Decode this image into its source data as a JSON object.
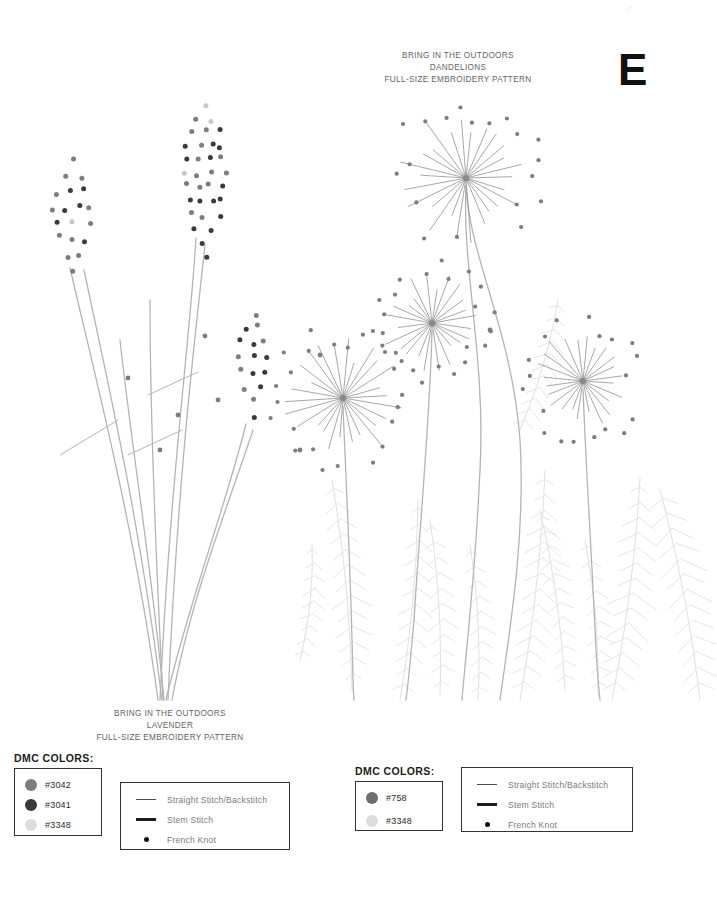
{
  "page": {
    "letter": "E",
    "background_color": "#ffffff"
  },
  "patterns": {
    "dandelions": {
      "brand_line": "BRING IN THE OUTDOORS",
      "name": "DANDELIONS",
      "subtitle": "FULL-SIZE EMBROIDERY PATTERN"
    },
    "lavender": {
      "brand_line": "BRING IN THE OUTDOORS",
      "name": "LAVENDER",
      "subtitle": "FULL-SIZE EMBROIDERY PATTERN"
    }
  },
  "legends": {
    "lavender": {
      "heading": "DMC COLORS:",
      "colors": [
        {
          "code": "#3042",
          "hex": "#7d7d7d"
        },
        {
          "code": "#3041",
          "hex": "#3a3a3a"
        },
        {
          "code": "#3348",
          "hex": "#dcdcdc"
        }
      ],
      "stitches": [
        {
          "label": "Straight Stitch/Backstitch",
          "mark": "thin-line"
        },
        {
          "label": "Stem Stitch",
          "mark": "thick-line"
        },
        {
          "label": "French Knot",
          "mark": "dot"
        }
      ]
    },
    "dandelions": {
      "heading": "DMC COLORS:",
      "colors": [
        {
          "code": "#758",
          "hex": "#6e6e6e"
        },
        {
          "code": "#3348",
          "hex": "#dcdcdc"
        }
      ],
      "stitches": [
        {
          "label": "Straight Stitch/Backstitch",
          "mark": "thin-line"
        },
        {
          "label": "Stem Stitch",
          "mark": "thick-line"
        },
        {
          "label": "French Knot",
          "mark": "dot"
        }
      ]
    }
  },
  "artwork": {
    "stem_color": "#b4b4b4",
    "foliage_color": "#e2e2e2",
    "ray_color": "#8a8a8a",
    "knot_dark": "#3a3a3a",
    "knot_mid": "#7d7d7d",
    "knot_light": "#c8c8c8",
    "dandelion_heads": [
      {
        "cx": 466,
        "cy": 178,
        "r_ray": 62,
        "r_dot": 76,
        "rays": 26
      },
      {
        "cx": 432,
        "cy": 323,
        "r_ray": 46,
        "r_dot": 58,
        "rays": 24
      },
      {
        "cx": 343,
        "cy": 398,
        "r_ray": 55,
        "r_dot": 68,
        "rays": 26
      },
      {
        "cx": 583,
        "cy": 381,
        "r_ray": 48,
        "r_dot": 60,
        "rays": 24
      }
    ],
    "lavender_spikes": [
      {
        "cx": 205,
        "cy": 180,
        "w": 52,
        "h": 150,
        "knots": 58
      },
      {
        "cx": 73,
        "cy": 215,
        "w": 46,
        "h": 110,
        "knots": 44
      },
      {
        "cx": 253,
        "cy": 365,
        "w": 38,
        "h": 105,
        "knots": 38
      }
    ]
  }
}
